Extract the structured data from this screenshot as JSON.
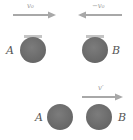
{
  "diagram": {
    "title": "",
    "colors": {
      "ball": "#707070",
      "ball_cap": "#b8b8b8",
      "arrow": "#a8a8a8",
      "label": "#555555",
      "velocity_label": "#9a9a9a",
      "background": "#ffffff"
    },
    "before": {
      "ball_a": {
        "label": "A"
      },
      "ball_b": {
        "label": "B"
      },
      "velocity_a": {
        "label": "v₀",
        "direction": "right"
      },
      "velocity_b": {
        "label": "−v₀",
        "direction": "left"
      }
    },
    "after": {
      "ball_a": {
        "label": "A"
      },
      "ball_b": {
        "label": "B"
      },
      "velocity_b": {
        "label": "v′",
        "direction": "right"
      }
    }
  }
}
